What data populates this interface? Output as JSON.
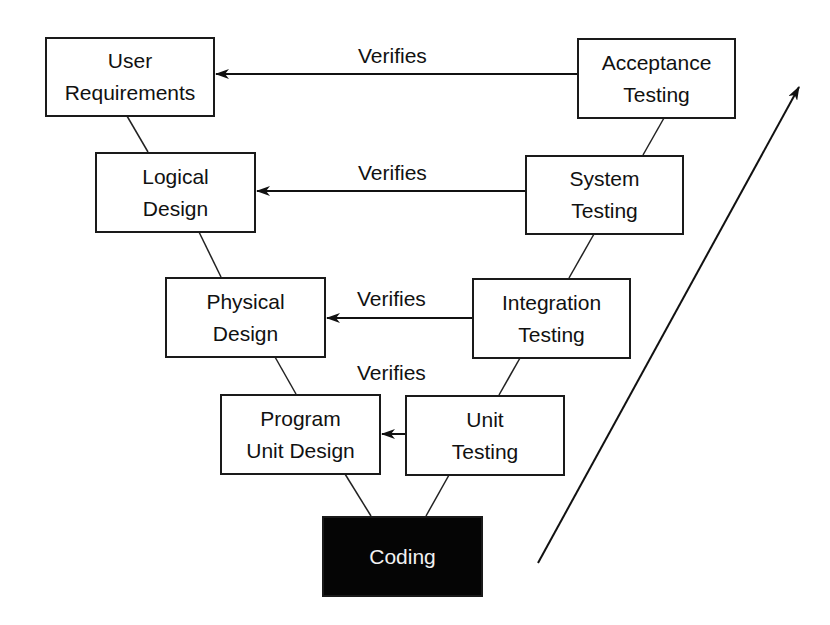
{
  "diagram": {
    "type": "V-model",
    "left_branch": [
      {
        "id": "user_requirements",
        "line1": "User",
        "line2": "Requirements"
      },
      {
        "id": "logical_design",
        "line1": "Logical",
        "line2": "Design"
      },
      {
        "id": "physical_design",
        "line1": "Physical",
        "line2": "Design"
      },
      {
        "id": "program_unit_design",
        "line1": "Program",
        "line2": "Unit Design"
      }
    ],
    "right_branch": [
      {
        "id": "acceptance_testing",
        "line1": "Acceptance",
        "line2": "Testing"
      },
      {
        "id": "system_testing",
        "line1": "System",
        "line2": "Testing"
      },
      {
        "id": "integration_testing",
        "line1": "Integration",
        "line2": "Testing"
      },
      {
        "id": "unit_testing",
        "line1": "Unit",
        "line2": "Testing"
      }
    ],
    "bottom": {
      "id": "coding",
      "label": "Coding"
    },
    "verifies_arrows": [
      {
        "from": "acceptance_testing",
        "to": "user_requirements",
        "label": "Verifies"
      },
      {
        "from": "system_testing",
        "to": "logical_design",
        "label": "Verifies"
      },
      {
        "from": "integration_testing",
        "to": "physical_design",
        "label": "Verifies"
      },
      {
        "from": "unit_testing",
        "to": "program_unit_design",
        "label": "Verifies"
      }
    ],
    "progress_arrow": {
      "direction": "up-right"
    },
    "colors": {
      "stroke": "#1a1a1a",
      "coding_fill": "#050505",
      "coding_text": "#f2f2f2",
      "background": "#ffffff"
    }
  }
}
